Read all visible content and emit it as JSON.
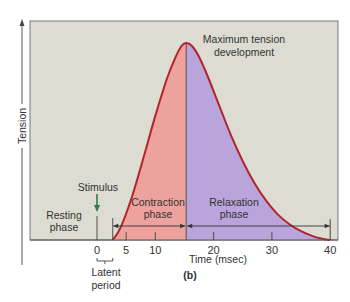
{
  "figure": {
    "panel_label": "(b)",
    "y_axis_label": "Tension",
    "x_axis_label": "Time (msec)",
    "x_ticks": [
      {
        "value": 0,
        "label": "0"
      },
      {
        "value": 5,
        "label": "5"
      },
      {
        "value": 10,
        "label": "10"
      },
      {
        "value": 20,
        "label": "20"
      },
      {
        "value": 30,
        "label": "30"
      },
      {
        "value": 40,
        "label": "40"
      }
    ],
    "x_range": [
      -11,
      41.5
    ],
    "annotations": {
      "peak": [
        "Maximum tension",
        "development"
      ],
      "stimulus": "Stimulus",
      "resting": [
        "Resting",
        "phase"
      ],
      "contraction": [
        "Contraction",
        "phase"
      ],
      "relaxation": [
        "Relaxation",
        "phase"
      ],
      "latent": [
        "Latent",
        "period"
      ]
    },
    "phases": {
      "stimulus_time": 0,
      "latent_end": 2.7,
      "peak_time": 15.3,
      "end_time": 40
    },
    "colors": {
      "background": "#dcdcd2",
      "contraction_fill": "#eea29d",
      "relaxation_fill": "#b9a4dc",
      "curve": "#b2232a",
      "stimulus_arrow": "#2e7d4a",
      "axis": "#555555"
    },
    "curve_points": [
      [
        2.7,
        0
      ],
      [
        4,
        0.06
      ],
      [
        6,
        0.22
      ],
      [
        8,
        0.42
      ],
      [
        10,
        0.63
      ],
      [
        12,
        0.82
      ],
      [
        13.5,
        0.93
      ],
      [
        14.5,
        0.985
      ],
      [
        15.3,
        1.0
      ],
      [
        16.3,
        0.985
      ],
      [
        17.5,
        0.93
      ],
      [
        19,
        0.83
      ],
      [
        21,
        0.68
      ],
      [
        23,
        0.53
      ],
      [
        25,
        0.4
      ],
      [
        27,
        0.29
      ],
      [
        29,
        0.2
      ],
      [
        31,
        0.13
      ],
      [
        33,
        0.08
      ],
      [
        35,
        0.045
      ],
      [
        37,
        0.02
      ],
      [
        38.5,
        0.007
      ],
      [
        40,
        0
      ]
    ]
  }
}
